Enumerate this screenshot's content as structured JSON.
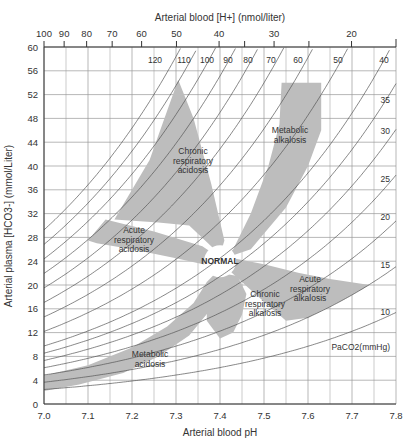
{
  "chart_data": {
    "type": "scatter",
    "xlabel": "Arterial blood pH",
    "ylabel": "Arterial plasma [HCO3-] (mmol/Liter)",
    "top_axis_label": "Arterial blood [H+] (nmol/liter)",
    "xlim": [
      7.0,
      7.8
    ],
    "ylim": [
      0,
      60
    ],
    "x_ticks": [
      "7.0",
      "7.1",
      "7.2",
      "7.3",
      "7.4",
      "7.5",
      "7.6",
      "7.7",
      "7.8"
    ],
    "y_ticks": [
      "0",
      "4",
      "8",
      "12",
      "16",
      "20",
      "24",
      "28",
      "32",
      "36",
      "40",
      "44",
      "48",
      "52",
      "56",
      "60"
    ],
    "top_ticks": [
      "100",
      "90",
      "80",
      "70",
      "60",
      "50",
      "40",
      "30",
      "20"
    ],
    "top_minor_ticks": [
      35,
      25
    ],
    "grid": true,
    "isopleth_label": "PaCO2(mmHg)",
    "isopleths": [
      120,
      110,
      100,
      90,
      80,
      70,
      60,
      50,
      40,
      35,
      30,
      25,
      20,
      15,
      10
    ],
    "isopleth_label_positions": {
      "top": [
        "120",
        "110",
        "100",
        "90",
        "80",
        "70",
        "60",
        "50",
        "40"
      ],
      "right": [
        "35",
        "30",
        "25",
        "20",
        "15",
        "10"
      ]
    },
    "regions": [
      {
        "name": "Metabolic acidosis",
        "label": [
          "Metabolic",
          "acidosis"
        ]
      },
      {
        "name": "Acute respiratory acidosis",
        "label": [
          "Acute",
          "respiratory",
          "acidosis"
        ]
      },
      {
        "name": "Chronic respiratory acidosis",
        "label": [
          "Chronic",
          "respiratory",
          "acidosis"
        ]
      },
      {
        "name": "Metabolic alkalosis",
        "label": [
          "Metabolic",
          "alkalosis"
        ]
      },
      {
        "name": "Acute respiratory alkalosis",
        "label": [
          "Acute",
          "respiratory",
          "alkalosis"
        ]
      },
      {
        "name": "Chronic respiratory alkalosis",
        "label": [
          "Chronic",
          "respiratory",
          "alkalosis"
        ]
      },
      {
        "name": "Normal",
        "label": [
          "NORMAL"
        ],
        "center": {
          "pH": 7.4,
          "HCO3": 24
        }
      }
    ]
  }
}
